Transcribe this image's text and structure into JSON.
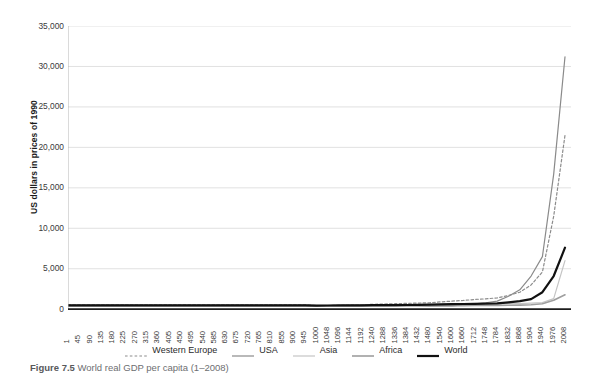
{
  "caption": {
    "figure_number": "Figure 7.5",
    "text": "World real GDP per capita (1–2008)"
  },
  "axis": {
    "ylabel": "US dollars in prices of 1990",
    "yticks": [
      "35,000",
      "30,000",
      "25,000",
      "20,000",
      "15,000",
      "10,000",
      "5,000",
      "0"
    ],
    "xticks": [
      "1",
      "45",
      "90",
      "135",
      "180",
      "225",
      "270",
      "315",
      "360",
      "405",
      "450",
      "495",
      "540",
      "585",
      "630",
      "675",
      "720",
      "765",
      "810",
      "855",
      "900",
      "945",
      "1000",
      "1048",
      "1096",
      "1144",
      "1192",
      "1240",
      "1288",
      "1336",
      "1384",
      "1432",
      "1480",
      "1540",
      "1600",
      "1660",
      "1712",
      "1748",
      "1784",
      "1832",
      "1868",
      "1904",
      "1940",
      "1976",
      "2008"
    ]
  },
  "legend": {
    "items": [
      {
        "label": "Western Europe",
        "color": "#8c8c8c",
        "style": "dashed",
        "width": 1.2
      },
      {
        "label": "USA",
        "color": "#8a8a8a",
        "style": "solid",
        "width": 1.2
      },
      {
        "label": "Asia",
        "color": "#c4c4c4",
        "style": "solid",
        "width": 1.2
      },
      {
        "label": "Africa",
        "color": "#9e9e9e",
        "style": "solid",
        "width": 1.6
      },
      {
        "label": "World",
        "color": "#111111",
        "style": "solid",
        "width": 2.2
      }
    ]
  },
  "chart_data": {
    "type": "line",
    "title": "World real GDP per capita (1–2008)",
    "xlabel": "",
    "ylabel": "US dollars in prices of 1990",
    "ylim": [
      0,
      35000
    ],
    "ytick_interval": 5000,
    "grid": "horizontal",
    "legend_position": "bottom-center",
    "x": [
      1,
      45,
      90,
      135,
      180,
      225,
      270,
      315,
      360,
      405,
      450,
      495,
      540,
      585,
      630,
      675,
      720,
      765,
      810,
      855,
      900,
      945,
      1000,
      1048,
      1096,
      1144,
      1192,
      1240,
      1288,
      1336,
      1384,
      1432,
      1480,
      1540,
      1600,
      1660,
      1712,
      1748,
      1784,
      1832,
      1868,
      1904,
      1940,
      1976,
      2008
    ],
    "series": [
      {
        "name": "Western Europe",
        "color": "#8c8c8c",
        "style": "dashed",
        "values": [
          576,
          576,
          576,
          576,
          576,
          576,
          576,
          576,
          576,
          576,
          576,
          576,
          576,
          576,
          576,
          576,
          576,
          576,
          576,
          576,
          576,
          576,
          427,
          450,
          480,
          520,
          560,
          600,
          640,
          680,
          720,
          760,
          798,
          900,
          1000,
          1080,
          1200,
          1280,
          1400,
          1700,
          2100,
          3000,
          4600,
          11500,
          21500
        ]
      },
      {
        "name": "USA",
        "color": "#8a8a8a",
        "style": "solid",
        "values": [
          400,
          400,
          400,
          400,
          400,
          400,
          400,
          400,
          400,
          400,
          400,
          400,
          400,
          400,
          400,
          400,
          400,
          400,
          400,
          400,
          400,
          400,
          400,
          400,
          400,
          400,
          400,
          400,
          400,
          400,
          400,
          400,
          400,
          400,
          400,
          527,
          650,
          800,
          1000,
          1600,
          2400,
          4100,
          6500,
          16700,
          31200
        ]
      },
      {
        "name": "Asia",
        "color": "#c4c4c4",
        "style": "solid",
        "values": [
          456,
          456,
          456,
          456,
          456,
          456,
          456,
          456,
          456,
          456,
          456,
          456,
          456,
          456,
          456,
          456,
          456,
          456,
          456,
          456,
          456,
          456,
          465,
          470,
          478,
          485,
          492,
          500,
          510,
          520,
          530,
          545,
          565,
          580,
          600,
          620,
          640,
          650,
          660,
          680,
          700,
          750,
          830,
          1300,
          6000
        ]
      },
      {
        "name": "Africa",
        "color": "#9e9e9e",
        "style": "solid",
        "values": [
          472,
          472,
          472,
          472,
          472,
          472,
          472,
          472,
          472,
          472,
          472,
          472,
          472,
          472,
          472,
          472,
          472,
          472,
          472,
          472,
          472,
          472,
          425,
          428,
          432,
          436,
          440,
          444,
          448,
          452,
          456,
          460,
          414,
          420,
          430,
          440,
          450,
          460,
          470,
          480,
          500,
          550,
          680,
          1100,
          1780
        ]
      },
      {
        "name": "World",
        "color": "#111111",
        "style": "solid",
        "values": [
          467,
          467,
          467,
          467,
          467,
          467,
          467,
          467,
          467,
          467,
          467,
          467,
          467,
          467,
          467,
          467,
          467,
          467,
          467,
          467,
          467,
          467,
          453,
          460,
          468,
          476,
          484,
          492,
          500,
          510,
          520,
          535,
          566,
          590,
          615,
          640,
          670,
          690,
          720,
          850,
          1000,
          1250,
          2100,
          4100,
          7600
        ]
      }
    ]
  }
}
